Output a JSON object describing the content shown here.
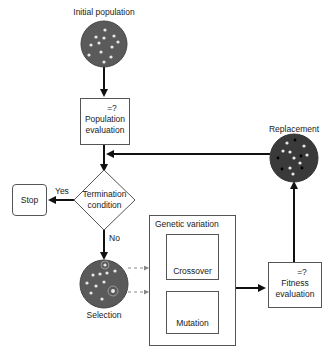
{
  "nodes": {
    "initial_population": {
      "label": "Initial population"
    },
    "population_evaluation": {
      "symbol": "=?",
      "line1": "Population",
      "line2": "evaluation"
    },
    "termination": {
      "line1": "Termination",
      "line2": "condition"
    },
    "stop": {
      "label": "Stop"
    },
    "selection": {
      "label": "Selection"
    },
    "genetic_variation": {
      "label": "Genetic variation"
    },
    "crossover": {
      "label": "Crossover"
    },
    "mutation": {
      "label": "Mutation"
    },
    "fitness_evaluation": {
      "symbol": "=?",
      "line1": "Fitness",
      "line2": "evaluation"
    },
    "replacement": {
      "label": "Replacement"
    }
  },
  "edges": {
    "yes_label": "Yes",
    "no_label": "No"
  },
  "colors": {
    "population_fill": "#5a5a5a",
    "dark_fill": "#3a3a3a",
    "line": "#111111",
    "box_border": "#555555",
    "dashed": "#888888"
  }
}
